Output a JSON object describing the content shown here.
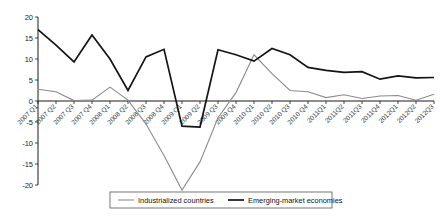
{
  "chart_data": {
    "type": "line",
    "title": "",
    "subtitle": "",
    "xlabel": "",
    "ylabel": "",
    "ylim": [
      -20,
      20
    ],
    "yticks": [
      20,
      15,
      10,
      5,
      0,
      -5,
      -10,
      -15,
      -20
    ],
    "grid": false,
    "legend_position": "bottom-center",
    "categories": [
      "2007 Q1",
      "2007 Q2",
      "2007 Q3",
      "2007 Q4",
      "2008 Q1",
      "2008 Q2",
      "2008 Q3",
      "2008 Q4",
      "2009 Q1",
      "2009 Q2",
      "2009 Q3",
      "2009 Q4",
      "2010 Q1",
      "2010 Q2",
      "2010 Q3",
      "2010 Q4",
      "2011Q1",
      "2011Q2",
      "2011Q3",
      "2011Q4",
      "2012Q1",
      "2012Q2",
      "2012Q3"
    ],
    "series": [
      {
        "name": "Industrialized countries",
        "color": "#8c8c8c",
        "values": [
          2.8,
          2.2,
          0.1,
          0.2,
          3.3,
          0.2,
          -5.5,
          -13.0,
          -21.2,
          -14.5,
          -4.0,
          2.0,
          11.0,
          6.5,
          2.5,
          2.2,
          0.8,
          1.5,
          0.6,
          1.2,
          1.3,
          0.2,
          1.6
        ]
      },
      {
        "name": "Emerging-market economies",
        "color": "#141414",
        "values": [
          17.0,
          13.3,
          9.3,
          15.7,
          10.0,
          2.5,
          10.5,
          12.3,
          -6.0,
          -6.2,
          12.2,
          11.0,
          9.5,
          12.5,
          11.0,
          8.0,
          7.3,
          6.8,
          7.0,
          5.2,
          6.0,
          5.5,
          5.6
        ]
      }
    ]
  },
  "legend": {
    "entries": [
      {
        "label": "Industrialized countries"
      },
      {
        "label": "Emerging-market economies"
      }
    ]
  }
}
